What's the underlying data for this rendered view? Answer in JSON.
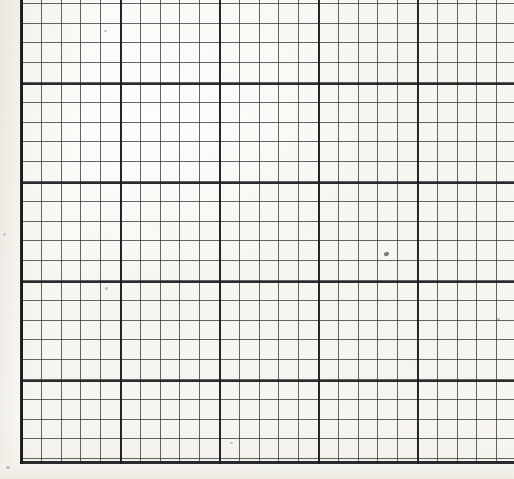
{
  "document": {
    "type": "scanned-graph-paper",
    "title": "Graph paper scan",
    "description": "A scanned sheet of engineering quadrille graph paper showing a ruled grid with fine minor squares and heavier major division lines. No printed text, numbers, labels or annotations are present.",
    "width_px": 514,
    "height_px": 479
  },
  "paper": {
    "background_color": "#faf9f5",
    "margin_color": "#f4f2ed",
    "left_margin_width_px": 21,
    "bottom_margin_height_px": 15,
    "texture": "scanned off-white paper with faint mottling and scan banding"
  },
  "grid": {
    "minor": {
      "spacing_px": 19.8,
      "line_color": "#3a3a3e",
      "line_width_px": 1.1,
      "opacity": 0.78
    },
    "major": {
      "spacing_px": 99,
      "cells_per_major": 5,
      "line_color": "#1a1a1e",
      "line_width_px": 2.2,
      "opacity": 0.92
    },
    "major_vertical_positions_px": [
      21,
      120,
      219,
      320,
      418,
      510
    ],
    "major_horizontal_positions_px": [
      83,
      182,
      276,
      371,
      462
    ],
    "minor_columns_visible": 25,
    "minor_rows_visible": 24,
    "clipped_edges": [
      "top",
      "right"
    ]
  },
  "borders": {
    "left": {
      "x_px": 20,
      "color": "#1b1b1f",
      "thickness_px": 2.6
    },
    "bottom": {
      "y_px": 461,
      "color": "#1b1b1f",
      "thickness_px": 2.8
    }
  },
  "artifacts": {
    "label": "scan specks",
    "items": [
      {
        "name": "center-speck",
        "x_px": 384,
        "y_px": 252,
        "size_px": 5
      },
      {
        "name": "upper-left-speck",
        "x_px": 104,
        "y_px": 30,
        "size_px": 3
      },
      {
        "name": "mid-left-speck",
        "x_px": 105,
        "y_px": 287,
        "size_px": 3
      },
      {
        "name": "right-speck",
        "x_px": 497,
        "y_px": 318,
        "size_px": 3
      },
      {
        "name": "lower-speck",
        "x_px": 230,
        "y_px": 442,
        "size_px": 3
      },
      {
        "name": "margin-speck",
        "x_px": 6,
        "y_px": 466,
        "size_px": 4
      },
      {
        "name": "margin-speck-2",
        "x_px": 3,
        "y_px": 233,
        "size_px": 3
      }
    ]
  }
}
